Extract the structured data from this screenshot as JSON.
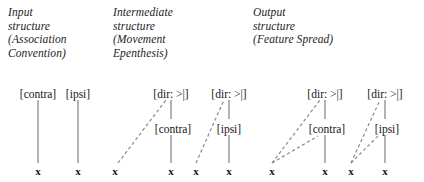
{
  "figure": {
    "background_color": "#ffffff",
    "line_color": "#8a8a8a",
    "text_color": "#1a1a1a"
  },
  "headings": {
    "input": "Input\nstructure\n(Association\nConvention)",
    "intermediate": "Intermediate\nstructure\n(Movement\nEpenthesis)",
    "output": "Output\nstructure\n(Feature Spread)"
  },
  "labels": {
    "contra": "[contra]",
    "ipsi": "[ipsi]",
    "dir": "[dir: >|]",
    "terminal": "x"
  },
  "structures": [
    {
      "name": "input-contra",
      "top_label": "[contra]",
      "mid_label": null,
      "terminals": [
        "x"
      ]
    },
    {
      "name": "input-ipsi",
      "top_label": "[ipsi]",
      "mid_label": null,
      "terminals": [
        "x"
      ]
    },
    {
      "name": "intermediate-contra",
      "top_label": "[dir: >|]",
      "mid_label": "[contra]",
      "terminals": [
        "x",
        "x"
      ]
    },
    {
      "name": "intermediate-ipsi",
      "top_label": "[dir: >|]",
      "mid_label": "[ipsi]",
      "terminals": [
        "x",
        "x"
      ]
    },
    {
      "name": "output-contra",
      "top_label": "[dir: >|]",
      "mid_label": "[contra]",
      "terminals": [
        "x",
        "x"
      ]
    },
    {
      "name": "output-ipsi",
      "top_label": "[dir: >|]",
      "mid_label": "[ipsi]",
      "terminals": [
        "x",
        "x"
      ]
    }
  ],
  "terminal_row": {
    "y": 171,
    "positions": [
      38,
      78,
      115,
      171,
      196,
      229,
      272,
      325,
      351,
      385
    ]
  }
}
